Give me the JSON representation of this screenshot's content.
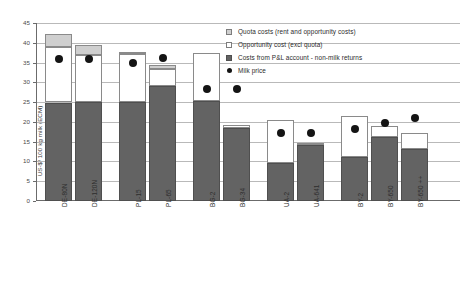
{
  "chart_data": {
    "type": "bar",
    "title": "",
    "xlabel": "",
    "ylabel": "US-$/ 100 kg milk (ECM)",
    "ylim": [
      0,
      45
    ],
    "ytick_labels": [
      "0",
      "5",
      "10",
      "15",
      "20",
      "25",
      "30",
      "35",
      "40",
      "45"
    ],
    "ytick_values": [
      0,
      5,
      10,
      15,
      20,
      25,
      30,
      35,
      40,
      45
    ],
    "grid": true,
    "stacked": true,
    "legend_position": "top-right",
    "categories": [
      "DE-80N",
      "DE-120N",
      "PL-15",
      "PL-65",
      "BG-2",
      "BG-34",
      "UA-2",
      "UA-641",
      "BY-2",
      "BY-650",
      "BY-650 ++"
    ],
    "series": [
      {
        "name": "Costs from P&L account - non-milk returns",
        "color": "#636363",
        "values": [
          24.9,
          25.0,
          25.0,
          29.0,
          25.3,
          18.5,
          9.6,
          14.1,
          11.0,
          16.1,
          13.2
        ]
      },
      {
        "name": "Opportunity cost (excl  quota)",
        "color": "#ffffff",
        "values": [
          14.1,
          12.0,
          12.2,
          4.4,
          12.2,
          0.8,
          10.9,
          0.6,
          10.5,
          2.9,
          4.1
        ]
      },
      {
        "name": "Quota costs (rent and opportunity costs)",
        "color": "#cfcfcf",
        "values": [
          3.2,
          2.4,
          0.5,
          0.9,
          0.0,
          0.0,
          0.0,
          0.0,
          0.0,
          0.0,
          0.0
        ]
      }
    ],
    "totals": [
      42.2,
      39.4,
      37.7,
      34.3,
      37.5,
      19.3,
      20.5,
      14.7,
      21.5,
      19.0,
      17.3
    ],
    "milk_price": {
      "name": "Milk price",
      "color": "#141414",
      "values": [
        35.8,
        35.8,
        35.0,
        36.2,
        28.2,
        28.3,
        17.3,
        17.3,
        18.3,
        19.6,
        20.9
      ]
    }
  },
  "legend": {
    "items": [
      {
        "label": "Quota costs (rent and opportunity costs)",
        "swatch": "quota-swatch"
      },
      {
        "label": "Opportunity cost (excl  quota)",
        "swatch": "opportunity-swatch"
      },
      {
        "label": "Costs from P&L account - non-milk returns",
        "swatch": "pl-swatch"
      },
      {
        "label": "Milk price",
        "swatch": "milk-price-marker"
      }
    ]
  }
}
